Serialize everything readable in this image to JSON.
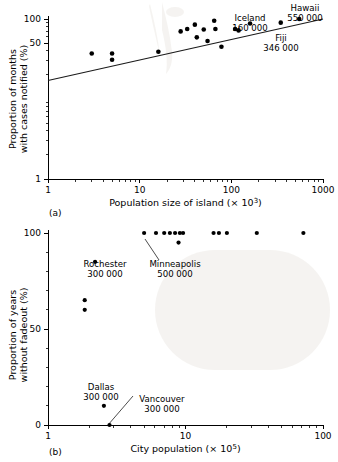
{
  "figure": {
    "panels": [
      {
        "tag": "(a)",
        "xlabel_prefix": "Population size of island (× 10",
        "xlabel_exp": "3",
        "xlabel_suffix": ")",
        "ylabel_line1": "Proportion of months",
        "ylabel_line2": "with cases notified (%)",
        "xticks": [
          "1",
          "10",
          "100",
          "1000"
        ],
        "yticks": [
          "1",
          "50",
          "100"
        ]
      },
      {
        "tag": "(b)",
        "xlabel_prefix": "City population (× 10",
        "xlabel_exp": "5",
        "xlabel_suffix": ")",
        "ylabel_line1": "Proportion of years",
        "ylabel_line2": "without fadeout (%)",
        "xticks": [
          "1",
          "10",
          "100"
        ],
        "yticks": [
          "0",
          "50",
          "100"
        ]
      }
    ],
    "annotations_a": [
      {
        "name": "Iceland",
        "value": "160 000"
      },
      {
        "name": "Hawaii",
        "value": "550 000"
      },
      {
        "name": "Fiji",
        "value": "346 000"
      }
    ],
    "annotations_b": [
      {
        "name": "Rochester",
        "value": "300 000"
      },
      {
        "name": "Minneapolis",
        "value": "500 000"
      },
      {
        "name": "Dallas",
        "value": "300 000"
      },
      {
        "name": "Vancouver",
        "value": "300 000"
      }
    ]
  },
  "chart_data": [
    {
      "type": "scatter",
      "panel": "(a)",
      "title": "",
      "xlabel": "Population size of island (× 10^3)",
      "ylabel": "Proportion of months with cases notified (%)",
      "xscale": "log",
      "yscale": "log",
      "xlim": [
        1,
        1000
      ],
      "ylim": [
        1,
        100
      ],
      "xticks": [
        1,
        10,
        100,
        1000
      ],
      "yticks": [
        1,
        50,
        100
      ],
      "grid": false,
      "legend": null,
      "points": [
        {
          "x": 3.0,
          "y": 37
        },
        {
          "x": 5.0,
          "y": 37
        },
        {
          "x": 5.0,
          "y": 31
        },
        {
          "x": 16.0,
          "y": 39
        },
        {
          "x": 28.0,
          "y": 70
        },
        {
          "x": 33.0,
          "y": 75
        },
        {
          "x": 40.0,
          "y": 85
        },
        {
          "x": 42.0,
          "y": 59
        },
        {
          "x": 50.0,
          "y": 74
        },
        {
          "x": 55.0,
          "y": 53
        },
        {
          "x": 65.0,
          "y": 95
        },
        {
          "x": 67.0,
          "y": 75
        },
        {
          "x": 78.0,
          "y": 45
        },
        {
          "x": 110.0,
          "y": 75
        },
        {
          "x": 120.0,
          "y": 72
        },
        {
          "x": 160.0,
          "y": 88,
          "label": "Iceland"
        },
        {
          "x": 346.0,
          "y": 90,
          "label": "Fiji"
        },
        {
          "x": 550.0,
          "y": 100,
          "label": "Hawaii"
        }
      ],
      "fit_line": {
        "x": [
          1,
          1000
        ],
        "y": [
          17,
          105
        ],
        "style": "solid"
      }
    },
    {
      "type": "scatter",
      "panel": "(b)",
      "title": "",
      "xlabel": "City population (× 10^5)",
      "ylabel": "Proportion of years without fadeout (%)",
      "xscale": "log",
      "yscale": "linear",
      "xlim": [
        1,
        100
      ],
      "ylim": [
        0,
        100
      ],
      "xticks": [
        1,
        10,
        100
      ],
      "yticks": [
        0,
        50,
        100
      ],
      "grid": false,
      "legend": null,
      "points": [
        {
          "x": 2.2,
          "y": 85,
          "label": "Rochester"
        },
        {
          "x": 1.85,
          "y": 65
        },
        {
          "x": 1.85,
          "y": 60
        },
        {
          "x": 2.55,
          "y": 10,
          "label": "Dallas"
        },
        {
          "x": 2.8,
          "y": 0,
          "label": "Vancouver"
        },
        {
          "x": 5.0,
          "y": 100,
          "label": "Minneapolis"
        },
        {
          "x": 6.1,
          "y": 100
        },
        {
          "x": 7.0,
          "y": 100
        },
        {
          "x": 7.7,
          "y": 100
        },
        {
          "x": 8.4,
          "y": 100
        },
        {
          "x": 9.1,
          "y": 100
        },
        {
          "x": 9.6,
          "y": 100
        },
        {
          "x": 8.9,
          "y": 95
        },
        {
          "x": 16.0,
          "y": 100
        },
        {
          "x": 17.5,
          "y": 100
        },
        {
          "x": 20.0,
          "y": 100
        },
        {
          "x": 33.0,
          "y": 100
        },
        {
          "x": 72.0,
          "y": 100
        }
      ]
    }
  ]
}
